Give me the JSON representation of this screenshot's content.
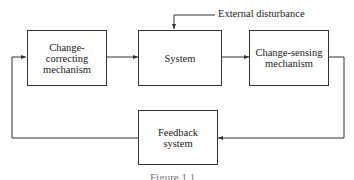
{
  "diagram": {
    "nodes": [
      {
        "id": "change_correcting",
        "label": "Change-correcting mechanism"
      },
      {
        "id": "system",
        "label": "System"
      },
      {
        "id": "change_sensing",
        "label": "Change-sensing mechanism"
      },
      {
        "id": "feedback",
        "label": "Feedback system"
      }
    ],
    "edges": [
      {
        "from": "change_correcting",
        "to": "system"
      },
      {
        "from": "system",
        "to": "change_sensing"
      },
      {
        "from": "change_sensing",
        "to": "feedback"
      },
      {
        "from": "feedback",
        "to": "change_correcting"
      },
      {
        "from": "external_disturbance",
        "to": "system"
      }
    ],
    "external_input": "External disturbance",
    "caption": "Figure 1.1"
  }
}
